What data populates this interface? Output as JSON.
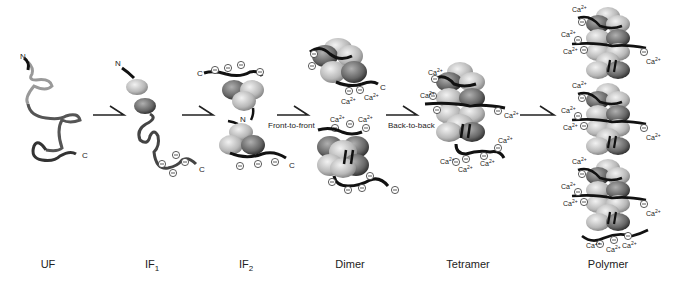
{
  "stages": [
    {
      "name": "UF",
      "sub": ""
    },
    {
      "name": "IF",
      "sub": "1"
    },
    {
      "name": "IF",
      "sub": "2"
    },
    {
      "name": "Dimer",
      "sub": ""
    },
    {
      "name": "Tetramer",
      "sub": ""
    },
    {
      "name": "Polymer",
      "sub": ""
    }
  ],
  "transitions": [
    {
      "label": ""
    },
    {
      "label": ""
    },
    {
      "label": "Front-to-front"
    },
    {
      "label": "Back-to-back"
    },
    {
      "label": ""
    }
  ],
  "termini": {
    "n": "N",
    "c": "C"
  },
  "ion_label": "Ca",
  "ion_charge": "2+",
  "anion_symbol": "⊖",
  "colors": {
    "dark": "#1a1a1a",
    "mid": "#666666",
    "light": "#bbbbbb",
    "bg": "#ffffff"
  }
}
